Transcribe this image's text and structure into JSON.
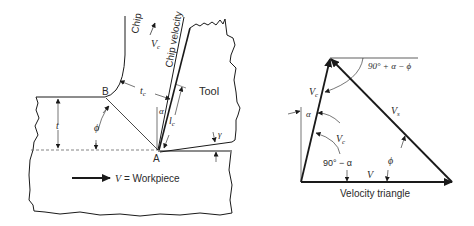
{
  "cutting_diagram": {
    "labels": {
      "chip": "Chip",
      "chip_velocity": "Chip velocity",
      "vc_arrow": "V",
      "vc_sub": "c",
      "tool": "Tool",
      "point_b": "B",
      "point_a": "A",
      "tc": "t",
      "tc_sub": "c",
      "lc": "l",
      "lc_sub": "c",
      "t": "t",
      "alpha": "α",
      "phi": "ϕ",
      "gamma": "γ",
      "workpiece_v": "V",
      "workpiece_text": " = Workpiece"
    }
  },
  "velocity_triangle": {
    "caption": "Velocity triangle",
    "labels": {
      "angle_top": "90° + α − ϕ",
      "vc_upper": "V",
      "vc_upper_sub": "c",
      "vc_inner": "V",
      "vc_inner_sub": "c",
      "vs": "V",
      "vs_sub": "s",
      "v": "V",
      "alpha": "α",
      "angle_inner": "90° − α",
      "phi": "ϕ"
    }
  },
  "colors": {
    "line": "#1a1a1a",
    "text": "#2a2a2a",
    "dashed": "#666666"
  }
}
